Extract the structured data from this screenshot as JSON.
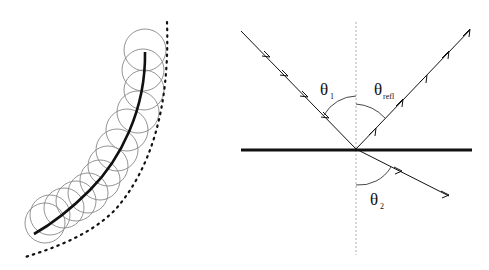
{
  "left_diagram": {
    "description": "Curve with overlapping circles along it and dotted envelope curve",
    "circle_count": 13
  },
  "right_diagram": {
    "labels": {
      "theta1": {
        "symbol": "θ",
        "sub": "1"
      },
      "theta_refl": {
        "symbol": "θ",
        "sub": "refl"
      },
      "theta2": {
        "symbol": "θ",
        "sub": "2"
      }
    }
  },
  "colors": {
    "line": "#111111",
    "circle": "#888888",
    "dash": "#999999"
  }
}
